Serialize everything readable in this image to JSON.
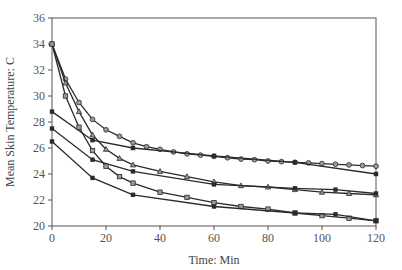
{
  "chart_data": {
    "type": "line",
    "title": "",
    "xlabel": "Time: Min",
    "ylabel": "Mean Skin Temperature: C",
    "xlim": [
      0,
      120
    ],
    "ylim": [
      20,
      36
    ],
    "xticks": [
      0,
      20,
      40,
      60,
      80,
      100,
      120
    ],
    "yticks": [
      20,
      22,
      24,
      26,
      28,
      30,
      32,
      34,
      36
    ],
    "grid": false,
    "legend": null,
    "series": [
      {
        "name": "Series A (open circles)",
        "marker": "open-circle",
        "x": [
          0,
          5,
          10,
          15,
          20,
          25,
          30,
          35,
          40,
          45,
          50,
          55,
          60,
          65,
          70,
          75,
          80,
          85,
          90,
          95,
          100,
          105,
          110,
          115,
          120
        ],
        "y": [
          34.0,
          31.3,
          29.5,
          28.2,
          27.4,
          26.9,
          26.4,
          26.1,
          25.9,
          25.7,
          25.55,
          25.45,
          25.35,
          25.25,
          25.15,
          25.1,
          25.0,
          24.95,
          24.9,
          24.85,
          24.8,
          24.75,
          24.7,
          24.65,
          24.6
        ]
      },
      {
        "name": "Series B (filled squares)",
        "marker": "filled-square",
        "x": [
          0,
          15,
          30,
          60,
          90,
          120
        ],
        "y": [
          28.8,
          26.6,
          26.0,
          25.4,
          24.9,
          24.0
        ]
      },
      {
        "name": "Series C (triangles)",
        "marker": "open-triangle",
        "x": [
          0,
          5,
          10,
          15,
          20,
          25,
          30,
          40,
          50,
          60,
          70,
          80,
          90,
          100,
          110,
          120
        ],
        "y": [
          34.0,
          31.0,
          28.8,
          27.0,
          25.9,
          25.2,
          24.7,
          24.2,
          23.8,
          23.4,
          23.1,
          23.0,
          22.8,
          22.6,
          22.5,
          22.4
        ]
      },
      {
        "name": "Series D (filled squares)",
        "marker": "filled-square",
        "x": [
          0,
          15,
          30,
          60,
          90,
          105,
          120
        ],
        "y": [
          27.5,
          25.1,
          24.2,
          23.2,
          22.9,
          22.8,
          22.5
        ]
      },
      {
        "name": "Series E (open squares)",
        "marker": "open-square",
        "x": [
          0,
          5,
          10,
          15,
          20,
          25,
          30,
          40,
          50,
          60,
          70,
          80,
          90,
          100,
          110,
          120
        ],
        "y": [
          34.0,
          30.0,
          27.6,
          25.8,
          24.6,
          23.8,
          23.3,
          22.6,
          22.2,
          21.8,
          21.5,
          21.3,
          21.0,
          20.8,
          20.6,
          20.4
        ]
      },
      {
        "name": "Series F (filled squares)",
        "marker": "filled-square",
        "x": [
          0,
          15,
          30,
          60,
          90,
          105,
          120
        ],
        "y": [
          26.5,
          23.7,
          22.4,
          21.5,
          21.0,
          20.9,
          20.4
        ]
      }
    ]
  },
  "colors": {
    "line": "#2b2b2b",
    "axis": "#555555",
    "open_marker_fill": "#9a9a9a"
  }
}
